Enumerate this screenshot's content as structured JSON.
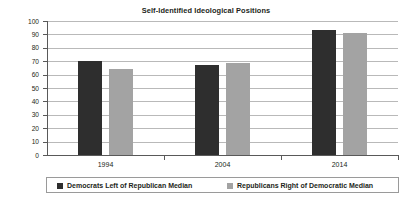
{
  "chart_data": {
    "type": "bar",
    "title": "Self-Identified Ideological Positions",
    "xlabel": "",
    "ylabel": "Percent of Respondents",
    "categories": [
      "1994",
      "2004",
      "2014"
    ],
    "series": [
      {
        "name": "Democrats Left of Republican Median",
        "color": "#2e2e2e",
        "values": [
          70,
          67,
          93
        ]
      },
      {
        "name": "Republicans Right of Democratic Median",
        "color": "#a3a3a3",
        "values": [
          64,
          69,
          91
        ]
      }
    ],
    "ylim": [
      0,
      100
    ],
    "yticks": [
      0,
      10,
      20,
      30,
      40,
      50,
      60,
      70,
      80,
      90,
      100
    ],
    "ytick_labels": [
      "0",
      "10",
      "20",
      "30",
      "40",
      "50",
      "60",
      "70",
      "80",
      "90",
      "100"
    ],
    "grid": true,
    "legend_position": "bottom"
  },
  "legend": {
    "entries": [
      {
        "label": "Democrats Left of Republican Median"
      },
      {
        "label": "Republicans Right of Democratic Median"
      }
    ]
  }
}
